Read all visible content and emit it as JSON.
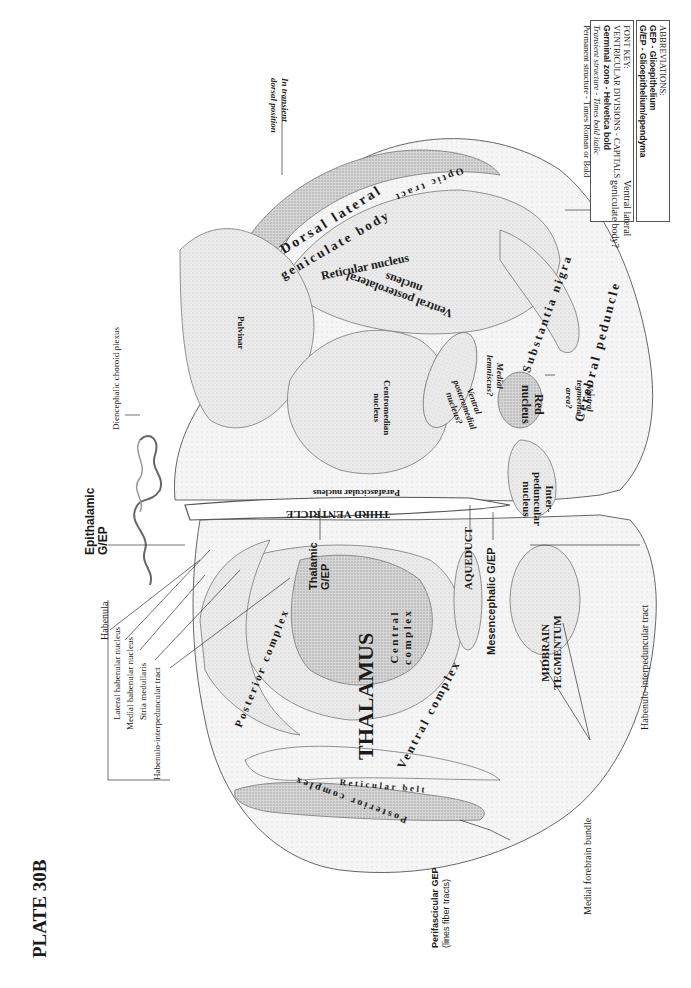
{
  "plate": {
    "title": "PLATE 30B"
  },
  "font_key": {
    "heading": "FONT KEY:",
    "lines": [
      "VENTRICULAR DIVISIONS - CAPITALS",
      "Germinal zone - Helvetica bold",
      "Transient structure - Times bold italic",
      "Permanent structure - Times Roman or Bold"
    ]
  },
  "abbreviations": {
    "heading": "ABBREVIATIONS:",
    "lines": [
      "GEP - Glioepithelium",
      "G/EP - Glioepithelium/ependyma"
    ]
  },
  "ventricular": {
    "third_ventricle": "THIRD VENTRICLE",
    "aqueduct": "AQUEDUCT",
    "thalamus": "THALAMUS",
    "midbrain_tegmentum_1": "MIDBRAIN",
    "midbrain_tegmentum_2": "TEGMENTUM"
  },
  "germinal": {
    "epithalamic_1": "Epithalamic",
    "epithalamic_2": "G/EP",
    "thalamic_1": "Thalamic",
    "thalamic_2": "G/EP",
    "mesencephalic": "Mesencephalic G/EP",
    "perifascicular_1": "Perifascicular GEP",
    "perifascicular_2": "(lines fiber tracts)"
  },
  "transient": {
    "in_transient_1": "In transient",
    "in_transient_2": "dorsal position"
  },
  "structures": {
    "optic_tract": "Optic tract",
    "dorsal_lateral": "Dorsal lateral",
    "geniculate_body": "geniculate body",
    "reticular_nucleus": "Reticular nucleus",
    "vpl_1": "Ventral posterolateral",
    "vpl_2": "nucleus",
    "substantia_nigra": "Substantia nigra",
    "cerebral_peduncle": "Cerebral peduncle",
    "pulvinar": "Pulvinar",
    "centromedian_1": "Centromedian",
    "centromedian_2": "nucleus",
    "vpm_1": "Ventral",
    "vpm_2": "posteromedial",
    "vpm_3": "nucleus?",
    "medial_lemniscus_1": "Medial",
    "medial_lemniscus_2": "lemniscus?",
    "red_nucleus_1": "Red",
    "red_nucleus_2": "nucleus",
    "vta_1": "Ventral",
    "vta_2": "tegmental",
    "vta_3": "area?",
    "parafascicular": "Parafascicular nucleus",
    "interpeduncular_1": "Inter-",
    "interpeduncular_2": "peduncular",
    "interpeduncular_3": "nucleus",
    "central_complex_1": "Central",
    "central_complex_2": "complex",
    "ventral_complex": "Ventral complex",
    "posterior_complex_upper": "Posterior complex",
    "posterior_complex_lower": "Posterior complex",
    "reticular_belt": "Reticular belt"
  },
  "callouts": {
    "vlgb_1": "Ventral lateral",
    "vlgb_2": "geniculate body?",
    "choroid_plexus": "Diencephalic choroid plexus",
    "habenula": "Habenula",
    "lateral_habenular": "Lateral habenular nucleus",
    "medial_habenular": "Medial habenular nucleus",
    "stria_medullaris": "Stria medullaris",
    "habenulo_ip_left": "Habenulo-interpeduncular tract",
    "habenulo_ip_right": "Habenulo-interpeduncular tract",
    "medial_forebrain": "Medial forebrain bundle"
  }
}
